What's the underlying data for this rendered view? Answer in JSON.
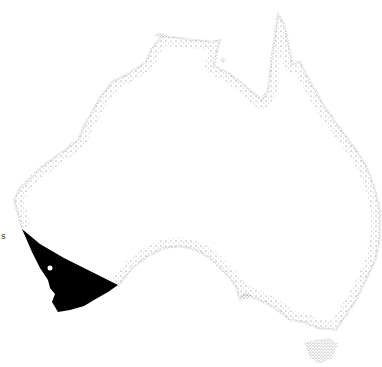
{
  "map": {
    "subject": "Australia outline distribution map",
    "background_color": "#ffffff",
    "outline_style": "stippled",
    "stipple_color": "#555555",
    "highlight_region": {
      "name": "south-west Western Australia",
      "fill_color": "#000000"
    },
    "edge_text_fragment": "s"
  }
}
